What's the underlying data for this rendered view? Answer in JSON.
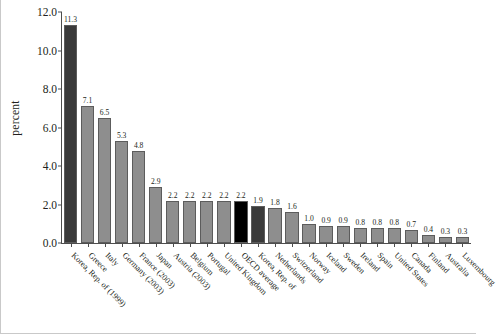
{
  "chart_data": {
    "type": "bar",
    "title": "",
    "xlabel": "",
    "ylabel": "percent",
    "ylim": [
      0.0,
      12.0
    ],
    "yticks": [
      "0.0",
      "2.0",
      "4.0",
      "6.0",
      "8.0",
      "10.0",
      "12.0"
    ],
    "ytick_values": [
      0.0,
      2.0,
      4.0,
      6.0,
      8.0,
      10.0,
      12.0
    ],
    "grid": false,
    "legend": "none",
    "categories": [
      "Korea, Rep. of (1999)",
      "Greece",
      "Italy",
      "Germany (2003)",
      "France (2003)",
      "Japan",
      "Austria (2003)",
      "Belgium",
      "Portugal",
      "United Kingdom",
      "OECD average",
      "Korea, Rep. of",
      "Netherlands",
      "Switzerland",
      "Norway",
      "Iceland",
      "Sweden",
      "Ireland",
      "Spain",
      "United States",
      "Canada",
      "Finland",
      "Australia",
      "Luxembourg"
    ],
    "values": [
      11.3,
      7.1,
      6.5,
      5.3,
      4.8,
      2.9,
      2.2,
      2.2,
      2.2,
      2.2,
      2.2,
      1.9,
      1.8,
      1.6,
      1.0,
      0.9,
      0.9,
      0.8,
      0.8,
      0.8,
      0.7,
      0.4,
      0.3,
      0.3
    ],
    "data_labels": [
      "11.3",
      "7.1",
      "6.5",
      "5.3",
      "4.8",
      "2.9",
      "2.2",
      "2.2",
      "2.2",
      "2.2",
      "2.2",
      "1.9",
      "1.8",
      "1.6",
      "1.0",
      "0.9",
      "0.9",
      "0.8",
      "0.8",
      "0.8",
      "0.7",
      "0.4",
      "0.3",
      "0.3"
    ],
    "bar_colors": [
      "#3a3a3a",
      "#8e8e8e",
      "#8e8e8e",
      "#8e8e8e",
      "#8e8e8e",
      "#8e8e8e",
      "#8e8e8e",
      "#8e8e8e",
      "#8e8e8e",
      "#8e8e8e",
      "#000000",
      "#3a3a3a",
      "#8e8e8e",
      "#8e8e8e",
      "#8e8e8e",
      "#8e8e8e",
      "#8e8e8e",
      "#8e8e8e",
      "#8e8e8e",
      "#8e8e8e",
      "#8e8e8e",
      "#8e8e8e",
      "#8e8e8e",
      "#8e8e8e"
    ],
    "highlight_colors": {
      "default_bar": "#8e8e8e",
      "korea_bar": "#3a3a3a",
      "oecd_average_bar": "#000000",
      "axis": "#4d4d4d",
      "text": "#231f20"
    }
  }
}
